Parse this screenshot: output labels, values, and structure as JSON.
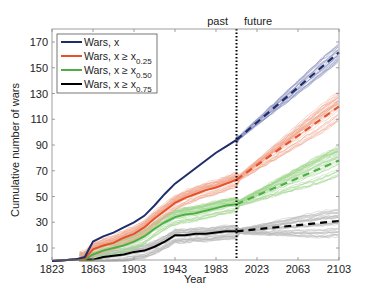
{
  "chart_data": {
    "type": "line",
    "title": "",
    "xlabel": "Year",
    "ylabel": "Cumulative number of wars",
    "xlim": [
      1823,
      2103
    ],
    "ylim": [
      0,
      175
    ],
    "xticks": [
      1823,
      1863,
      1903,
      1943,
      1983,
      2023,
      2063,
      2103
    ],
    "yticks": [
      10,
      30,
      50,
      70,
      90,
      110,
      130,
      150,
      170
    ],
    "divider": {
      "year": 2003,
      "left_label": "past",
      "right_label": "future",
      "style": "dotted"
    },
    "legend": {
      "position": "upper left",
      "entries": [
        {
          "label": "Wars, x",
          "sub": "",
          "color": "#1f2d6b"
        },
        {
          "label": "Wars, x ≥ x",
          "sub": "0.25",
          "color": "#e8502a"
        },
        {
          "label": "Wars, x ≥ x",
          "sub": "0.50",
          "color": "#4caf45"
        },
        {
          "label": "Wars, x ≥ x",
          "sub": "0.75",
          "color": "#000000"
        }
      ]
    },
    "series": [
      {
        "name": "Wars, x",
        "color": "#1f2d6b",
        "band_color": "#8e93c0",
        "past": {
          "x": [
            1823,
            1845,
            1855,
            1863,
            1873,
            1883,
            1893,
            1903,
            1913,
            1923,
            1933,
            1943,
            1953,
            1963,
            1973,
            1983,
            1993,
            2003
          ],
          "y": [
            0,
            1,
            3,
            15,
            19,
            22,
            26,
            30,
            35,
            43,
            52,
            60,
            66,
            72,
            78,
            84,
            89,
            94
          ]
        },
        "forecast": {
          "x": [
            2003,
            2103
          ],
          "y": [
            94,
            162
          ]
        },
        "band_halfwidth": 7
      },
      {
        "name": "Wars, x ≥ x0.25",
        "color": "#e8502a",
        "band_color": "#f0a58c",
        "past": {
          "x": [
            1823,
            1845,
            1855,
            1863,
            1873,
            1883,
            1893,
            1903,
            1913,
            1923,
            1933,
            1943,
            1953,
            1963,
            1973,
            1983,
            1993,
            2003
          ],
          "y": [
            0,
            1,
            2,
            9,
            12,
            14,
            18,
            21,
            26,
            33,
            39,
            45,
            49,
            52,
            55,
            57,
            60,
            63
          ]
        },
        "forecast": {
          "x": [
            2003,
            2103
          ],
          "y": [
            63,
            120
          ]
        },
        "band_halfwidth": 12
      },
      {
        "name": "Wars, x ≥ x0.50",
        "color": "#4caf45",
        "band_color": "#9fd48e",
        "past": {
          "x": [
            1823,
            1845,
            1855,
            1863,
            1873,
            1883,
            1893,
            1903,
            1913,
            1923,
            1933,
            1943,
            1953,
            1963,
            1973,
            1983,
            1993,
            2003
          ],
          "y": [
            0,
            1,
            1,
            5,
            8,
            10,
            12,
            15,
            19,
            25,
            30,
            34,
            36,
            37,
            39,
            41,
            43,
            44
          ]
        },
        "forecast": {
          "x": [
            2003,
            2103
          ],
          "y": [
            44,
            78
          ]
        },
        "band_halfwidth": 12
      },
      {
        "name": "Wars, x ≥ x0.75",
        "color": "#000000",
        "band_color": "#b5b5b5",
        "past": {
          "x": [
            1823,
            1845,
            1855,
            1863,
            1873,
            1883,
            1893,
            1903,
            1913,
            1923,
            1933,
            1943,
            1953,
            1963,
            1973,
            1983,
            1993,
            2003
          ],
          "y": [
            0,
            1,
            1,
            1,
            3,
            4,
            5,
            7,
            8,
            11,
            15,
            20,
            20,
            21,
            21,
            22,
            23,
            23
          ]
        },
        "forecast": {
          "x": [
            2003,
            2103
          ],
          "y": [
            23,
            31
          ]
        },
        "band_halfwidth": 12
      }
    ]
  }
}
